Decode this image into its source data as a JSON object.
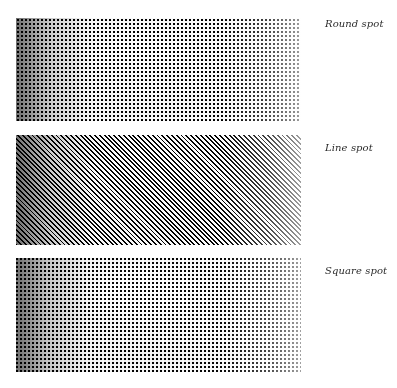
{
  "figure": {
    "background_color": "#ffffff",
    "text_color": "#2b2b2b",
    "panel_count": 3
  },
  "panels": [
    {
      "id": "round-spot",
      "label": "Round spot",
      "spot_shape": "round",
      "screen_angle_deg": 0,
      "screen_pitch_px": 4,
      "x": 16,
      "y": 18,
      "width": 285,
      "height": 103,
      "tone_direction": "dark-left-to-light-right",
      "subject": "photograph of a bright dome-like subject with dark cast shadow"
    },
    {
      "id": "line-spot",
      "label": "Line spot",
      "spot_shape": "line",
      "screen_angle_deg": 45,
      "screen_pitch_px": 3.4,
      "x": 16,
      "y": 135,
      "width": 285,
      "height": 110,
      "tone_direction": "dark-left-to-light-right",
      "subject": "photograph of a bright dome-like subject with dark cast shadow"
    },
    {
      "id": "square-spot",
      "label": "Square spot",
      "spot_shape": "square",
      "screen_angle_deg": 0,
      "screen_pitch_px": 4,
      "x": 16,
      "y": 258,
      "width": 285,
      "height": 114,
      "tone_direction": "dark-left-to-light-right",
      "subject": "photograph of a bright dome-like subject with dark cast shadow"
    }
  ],
  "labels": {
    "round": "Round spot",
    "line": "Line spot",
    "square": "Square spot"
  },
  "label_positions": {
    "round_y": 18,
    "line_y": 142,
    "square_y": 265,
    "x": 325
  }
}
